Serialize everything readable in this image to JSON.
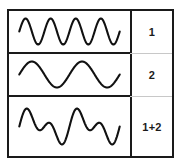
{
  "figure": {
    "line_color": "#111111",
    "border_color": "#1a1a1a",
    "background_color": "#ffffff",
    "rows": [
      {
        "label": "1",
        "wave_name": "high-frequency-wave",
        "cycles": 4,
        "amplitude": 1.0,
        "phase": 0.0
      },
      {
        "label": "2",
        "wave_name": "low-frequency-wave",
        "cycles": 2,
        "amplitude": 1.0,
        "phase": 0.0
      },
      {
        "label": "1+2",
        "wave_name": "sum-wave",
        "cycles": 0,
        "amplitude": 2.0,
        "phase": 0.0
      }
    ]
  },
  "chart_data": {
    "type": "line",
    "xlabel": "",
    "ylabel": "",
    "grid": false,
    "legend": "right-column-labels",
    "axis_visible": false,
    "x_range": [
      0,
      1
    ],
    "series": [
      {
        "name": "1",
        "description": "sine wave, 4 cycles across the cell",
        "cycles": 4,
        "amplitude": 1.0,
        "phase_deg": 0,
        "ylim": [
          -1.2,
          1.2
        ]
      },
      {
        "name": "2",
        "description": "sine wave, 2 cycles across the cell",
        "cycles": 2,
        "amplitude": 1.0,
        "phase_deg": 0,
        "ylim": [
          -1.2,
          1.2
        ]
      },
      {
        "name": "1+2",
        "description": "pointwise sum of wave 1 and wave 2",
        "components": [
          {
            "cycles": 4,
            "amplitude": 1.0,
            "phase_deg": 0
          },
          {
            "cycles": 2,
            "amplitude": 1.0,
            "phase_deg": 0
          }
        ],
        "amplitude": 2.0,
        "ylim": [
          -2.2,
          2.2
        ]
      }
    ]
  }
}
